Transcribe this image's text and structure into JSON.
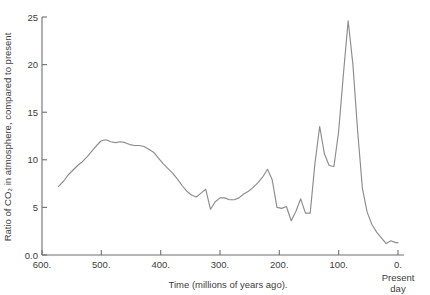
{
  "chart_data": {
    "type": "line",
    "title": "",
    "subtitle": "",
    "xlabel": "Time (millions of years ago).",
    "ylabel": "Ratio of CO₂ in atmosphere, compared to present",
    "xlim": [
      600,
      0
    ],
    "ylim": [
      0,
      26
    ],
    "x_axis_inverted": true,
    "grid": false,
    "legend": null,
    "x_ticks": [
      "600.",
      "500.",
      "400.",
      "300.",
      "200.",
      "100.",
      "0."
    ],
    "x_tick_values": [
      600,
      500,
      400,
      300,
      200,
      100,
      0
    ],
    "y_ticks": [
      "0.0",
      "5",
      "10",
      "15",
      "20",
      "25"
    ],
    "y_tick_values": [
      0,
      5,
      10,
      15,
      20,
      25
    ],
    "annotations": [
      {
        "text": "Present",
        "x": 0,
        "note": "below-zero-tick-line-1"
      },
      {
        "text": "day",
        "x": 0,
        "note": "below-zero-tick-line-2"
      }
    ],
    "series": [
      {
        "name": "CO2 ratio",
        "color": "#8c8c8c",
        "x": [
          572,
          563,
          556,
          548,
          540,
          532,
          524,
          516,
          508,
          500,
          492,
          484,
          476,
          468,
          460,
          452,
          444,
          436,
          428,
          420,
          412,
          404,
          396,
          388,
          380,
          372,
          364,
          356,
          348,
          340,
          332,
          324,
          316,
          308,
          300,
          292,
          284,
          276,
          268,
          260,
          252,
          244,
          236,
          228,
          220,
          212,
          204,
          196,
          188,
          180,
          172,
          164,
          156,
          148,
          140,
          132,
          124,
          116,
          108,
          100,
          92,
          84,
          76,
          68,
          60,
          52,
          44,
          36,
          28,
          20,
          12,
          4,
          0
        ],
        "y": [
          7.2,
          7.8,
          8.4,
          8.9,
          9.4,
          9.8,
          10.3,
          10.9,
          11.5,
          12.0,
          12.1,
          11.9,
          11.8,
          11.9,
          11.8,
          11.6,
          11.5,
          11.5,
          11.4,
          11.1,
          10.8,
          10.2,
          9.6,
          9.1,
          8.6,
          8.0,
          7.3,
          6.7,
          6.3,
          6.1,
          6.5,
          6.9,
          4.8,
          5.6,
          6.0,
          6.0,
          5.8,
          5.8,
          6.0,
          6.4,
          6.7,
          7.1,
          7.6,
          8.2,
          9.0,
          7.9,
          5.0,
          4.9,
          5.1,
          3.6,
          4.6,
          5.9,
          4.4,
          4.4,
          9.6,
          13.5,
          10.6,
          9.4,
          9.3,
          13.0,
          19.0,
          24.6,
          20.0,
          13.0,
          7.0,
          4.5,
          3.2,
          2.4,
          1.8,
          1.2,
          1.5,
          1.3,
          1.3
        ]
      }
    ]
  },
  "axis": {
    "y_label_text": "Ratio of CO₂ in atmosphere, compared to present",
    "x_label_text": "Time (millions of years ago).",
    "present_day_line1": "Present",
    "present_day_line2": "day"
  },
  "colors": {
    "line": "#8c8c8c",
    "axis": "#6f6f6f",
    "text": "#3d3d3d",
    "background": "#ffffff"
  }
}
